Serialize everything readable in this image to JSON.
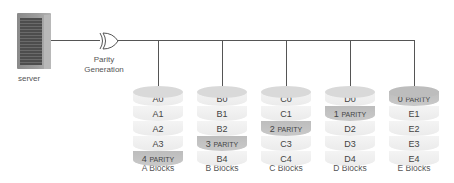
{
  "server": {
    "label": "server"
  },
  "gate": {
    "label_line1": "Parity",
    "label_line2": "Generation"
  },
  "cylinders": [
    {
      "label": "A Blocks",
      "segments": [
        {
          "text": "A0",
          "parity": false
        },
        {
          "text": "A1",
          "parity": false
        },
        {
          "text": "A2",
          "parity": false
        },
        {
          "text": "A3",
          "parity": false
        },
        {
          "num": "4",
          "tag": "PARITY",
          "parity": true
        }
      ]
    },
    {
      "label": "B Blocks",
      "segments": [
        {
          "text": "B0",
          "parity": false
        },
        {
          "text": "B1",
          "parity": false
        },
        {
          "text": "B2",
          "parity": false
        },
        {
          "num": "3",
          "tag": "PARITY",
          "parity": true
        },
        {
          "text": "B4",
          "parity": false
        }
      ]
    },
    {
      "label": "C Blocks",
      "segments": [
        {
          "text": "C0",
          "parity": false
        },
        {
          "text": "C1",
          "parity": false
        },
        {
          "num": "2",
          "tag": "PARITY",
          "parity": true
        },
        {
          "text": "C3",
          "parity": false
        },
        {
          "text": "C4",
          "parity": false
        }
      ]
    },
    {
      "label": "D Blocks",
      "segments": [
        {
          "text": "D0",
          "parity": false
        },
        {
          "num": "1",
          "tag": "PARITY",
          "parity": true
        },
        {
          "text": "D2",
          "parity": false
        },
        {
          "text": "D3",
          "parity": false
        },
        {
          "text": "D4",
          "parity": false
        }
      ]
    },
    {
      "label": "E Blocks",
      "segments": [
        {
          "num": "0",
          "tag": "PARITY",
          "parity": true
        },
        {
          "text": "E1",
          "parity": false
        },
        {
          "text": "E2",
          "parity": false
        },
        {
          "text": "E3",
          "parity": false
        },
        {
          "text": "E4",
          "parity": false
        }
      ]
    }
  ]
}
